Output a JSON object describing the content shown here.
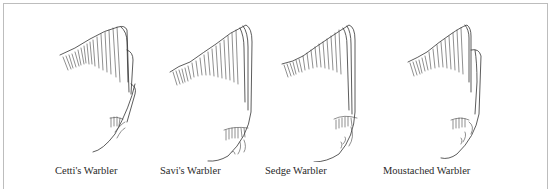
{
  "figure": {
    "panels": [
      {
        "label": "Cetti's Warbler",
        "caption_x": 55
      },
      {
        "label": "Savi's Warbler",
        "caption_x": 160
      },
      {
        "label": "Sedge Warbler",
        "caption_x": 265
      },
      {
        "label": "Moustached Warbler",
        "caption_x": 383
      }
    ],
    "colors": {
      "line": "#444444",
      "frame": "#bdbdbd",
      "background": "#ffffff"
    }
  }
}
